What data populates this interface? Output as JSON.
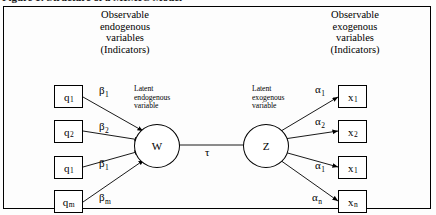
{
  "caption": "Figure 1: Structure of a MIMIC Model",
  "figure": {
    "header_left": {
      "line1": "Observable",
      "line2": "endogenous",
      "line3": "variables",
      "line4": "(Indicators)"
    },
    "header_right": {
      "line1": "Observable",
      "line2": "exogenous",
      "line3": "variables",
      "line4": "(Indicators)"
    },
    "latent_endogenous": {
      "symbol": "W",
      "label_line1": "Latent",
      "label_line2": "endogenous",
      "label_line3": "variable"
    },
    "latent_exogenous": {
      "symbol": "Z",
      "label_line1": "Latent",
      "label_line2": "exogenous",
      "label_line3": "variable"
    },
    "structural_coefficient": "τ",
    "indicators_left": [
      {
        "var_base": "q",
        "var_sub": "1",
        "coef_base": "β",
        "coef_sub": "1"
      },
      {
        "var_base": "q",
        "var_sub": "2",
        "coef_base": "β",
        "coef_sub": "2"
      },
      {
        "var_base": "q",
        "var_sub": "1",
        "coef_base": "β",
        "coef_sub": "1"
      },
      {
        "var_base": "q",
        "var_sub": "m",
        "coef_base": "β",
        "coef_sub": "m"
      }
    ],
    "indicators_right": [
      {
        "var_base": "x",
        "var_sub": "1",
        "coef_base": "α",
        "coef_sub": "1"
      },
      {
        "var_base": "x",
        "var_sub": "2",
        "coef_base": "α",
        "coef_sub": "2"
      },
      {
        "var_base": "x",
        "var_sub": "1",
        "coef_base": "α",
        "coef_sub": "1"
      },
      {
        "var_base": "x",
        "var_sub": "n",
        "coef_base": "α",
        "coef_sub": "n"
      }
    ],
    "colors": {
      "stroke": "#000000",
      "background": "#fdfdfd",
      "box_fill": "#ffffff"
    }
  }
}
